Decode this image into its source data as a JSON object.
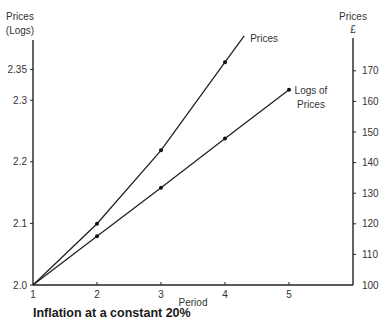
{
  "chart_data": {
    "type": "line",
    "title": "Inflation at a constant 20%",
    "xlabel": "Period",
    "ylabel_left": [
      "Prices",
      "(Logs)"
    ],
    "ylabel_right": [
      "Prices",
      "£"
    ],
    "x": [
      1,
      2,
      3,
      4,
      5
    ],
    "x_ticks": [
      "1",
      "2",
      "3",
      "4",
      "5"
    ],
    "ylim_left": [
      2.0,
      2.4
    ],
    "ylim_right": [
      100,
      175
    ],
    "y_ticks_left": [
      "2.0",
      "2.1",
      "2.2",
      "2.3",
      "2.35"
    ],
    "y_ticks_left_values": [
      2.0,
      2.1,
      2.2,
      2.3,
      2.35
    ],
    "y_ticks_right": [
      "100",
      "110",
      "120",
      "130",
      "140",
      "150",
      "160",
      "170"
    ],
    "y_ticks_right_values": [
      100,
      110,
      120,
      130,
      140,
      150,
      160,
      170
    ],
    "grid": false,
    "series": [
      {
        "name": "Prices",
        "axis": "right",
        "x": [
          1,
          2,
          3,
          4
        ],
        "values": [
          100,
          120,
          144,
          172.8
        ],
        "extends_to_x": 4.3,
        "label": "Prices"
      },
      {
        "name": "Logs of Prices",
        "axis": "left",
        "x": [
          1,
          2,
          3,
          4,
          5
        ],
        "values": [
          2.0,
          2.079,
          2.158,
          2.238,
          2.317
        ],
        "label_lines": [
          "Logs of",
          "Prices"
        ]
      }
    ]
  }
}
